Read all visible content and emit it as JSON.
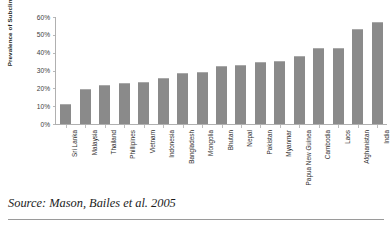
{
  "chart_data": {
    "type": "bar",
    "title": "",
    "xlabel": "",
    "ylabel": "Prevalence of Subclinical VAD",
    "ylim": [
      0,
      60
    ],
    "ytick_labels": [
      "60%",
      "50%",
      "40%",
      "30%",
      "20%",
      "10%",
      "0%"
    ],
    "ytick_values": [
      60,
      50,
      40,
      30,
      20,
      10,
      0
    ],
    "grid": false,
    "legend": "none",
    "bar_color": "#8a8a8a",
    "categories": [
      "Sri Lanka",
      "Malaysia",
      "Thailand",
      "Phillipines",
      "Vietnam",
      "Indonesia",
      "Bangladesh",
      "Mongolia",
      "Bhutan",
      "Nepal",
      "Pakistan",
      "Myanmar",
      "Papua New Guinea",
      "Cambodia",
      "Laos",
      "Afghanistan",
      "India"
    ],
    "values": [
      11,
      19.8,
      22,
      23,
      23.5,
      26,
      28.5,
      29,
      32.5,
      33,
      35,
      35.5,
      38,
      42.5,
      42.5,
      53.5,
      57
    ]
  },
  "source": {
    "text": "Source: Mason, Bailes et al. 2005"
  }
}
